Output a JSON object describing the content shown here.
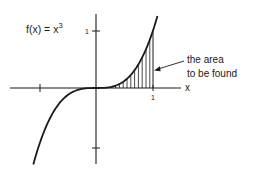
{
  "figure": {
    "function_label": "f(x) = x",
    "function_exponent": "3",
    "x_axis_label": "x",
    "x_tick_label": "1",
    "y_tick_label": "1",
    "annotation_line1": "the area",
    "annotation_line2": "to be found",
    "colors": {
      "ink": "#1a1a1a",
      "background": "#ffffff"
    }
  },
  "chart_data": {
    "type": "line",
    "function": "x^3",
    "xlabel": "x",
    "ylabel": "",
    "x_ticks": [
      -1,
      1
    ],
    "x_tick_labels": [
      "",
      "1"
    ],
    "y_ticks": [
      -1,
      1
    ],
    "y_tick_labels": [
      "",
      "1"
    ],
    "xlim": [
      -1.35,
      1.2
    ],
    "ylim": [
      -1.3,
      1.3
    ],
    "shaded_region": {
      "from": 0,
      "to": 1,
      "style": "vertical hatching",
      "label": "the area to be found"
    },
    "grid": false,
    "legend": null
  }
}
